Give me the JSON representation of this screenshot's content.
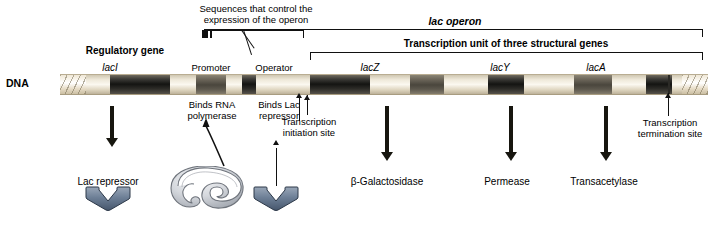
{
  "figure": {
    "dna_label": "DNA",
    "top_annotations": {
      "control_sequences": "Sequences that control the\nexpression of the operon",
      "lac_operon": "lac operon",
      "transcription_unit": "Transcription unit of three structural genes",
      "regulatory_gene": "Regulatory gene"
    },
    "gene_labels": [
      {
        "name": "lacI",
        "italic": true
      },
      {
        "name": "Promoter",
        "italic": false
      },
      {
        "name": "Operator",
        "italic": false
      },
      {
        "name": "lacZ",
        "italic": true
      },
      {
        "name": "lacY",
        "italic": true
      },
      {
        "name": "lacA",
        "italic": true
      }
    ],
    "callouts": [
      {
        "text": "Binds RNA\npolymerase"
      },
      {
        "text": "Binds Lac\nrepressor"
      },
      {
        "text": "Transcription\ninitiation site"
      },
      {
        "text": "Transcription\ntermination site"
      }
    ],
    "products": [
      {
        "label": "Lac repressor"
      },
      {
        "label": "β-Galactosidase"
      },
      {
        "label": "Permease"
      },
      {
        "label": "Transacetylase"
      }
    ],
    "colors": {
      "dna_dark": "#141412",
      "dna_light": "#fbf8f0",
      "repressor_fill": "#6d7f96",
      "polymerase_fill": "#c9ccd1",
      "arrow": "#17160f"
    }
  }
}
